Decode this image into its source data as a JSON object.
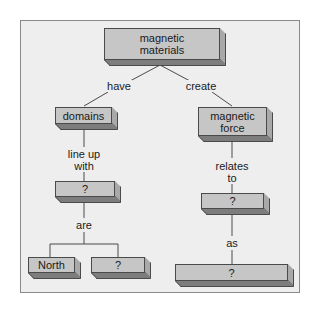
{
  "concept_map": {
    "nodes": {
      "root": "magnetic\nmaterials",
      "domains": "domains",
      "magnetic_force": "magnetic\nforce",
      "left_unknown": "?",
      "north": "North",
      "pole_unknown": "?",
      "right_unknown": "?",
      "bottom_unknown": "?"
    },
    "links": {
      "have": "have",
      "create": "create",
      "line_up_with": "line up\nwith",
      "relates_to": "relates\nto",
      "are": "are",
      "as": "as"
    }
  },
  "colors": {
    "frame_background": "#eeeeee",
    "box_face": "#c6c6c6",
    "box_side": "#a9a9a9",
    "box_bottom": "#7d7d7d",
    "line": "#4a4a4a"
  }
}
